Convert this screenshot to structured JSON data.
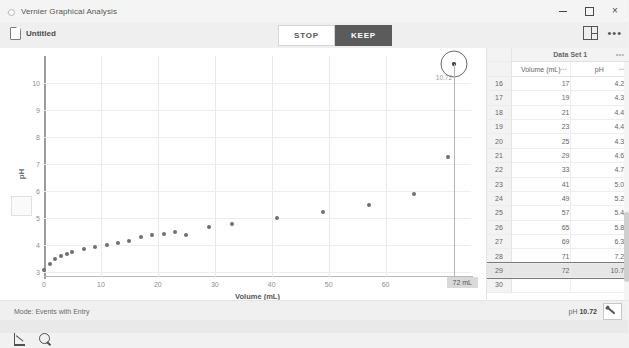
{
  "window": {
    "title": "Vernier Graphical Analysis",
    "logo_icon": "vernier-logo-icon",
    "minimize_label": "minimize-icon",
    "maximize_label": "maximize-icon",
    "close_label": "×"
  },
  "toolbar": {
    "doc_icon": "document-icon",
    "doc_name": "Untitled",
    "stop_label": "STOP",
    "keep_label": "KEEP",
    "layout_icon": "layout-split-icon",
    "more_icon": "•••"
  },
  "graph": {
    "ylabel": "pH",
    "xlabel": "Volume (mL)",
    "x_badge": "72 mL",
    "cursor_value": "10.72",
    "tool_graph_icon": "graph-axes-icon",
    "tool_zoom_icon": "zoom-magnifier-icon"
  },
  "chart_data": {
    "type": "scatter",
    "title": "",
    "xlabel": "Volume (mL)",
    "ylabel": "pH",
    "xlim": [
      0,
      75
    ],
    "ylim": [
      2.8,
      11.0
    ],
    "xticks": [
      0,
      10,
      20,
      30,
      40,
      50,
      60
    ],
    "yticks": [
      3,
      4,
      5,
      6,
      7,
      8,
      9,
      10
    ],
    "grid": true,
    "legend": "none",
    "marker_color": "#6f6f6f",
    "points": [
      {
        "x": 0,
        "y": 3.07
      },
      {
        "x": 1,
        "y": 3.3
      },
      {
        "x": 2,
        "y": 3.48
      },
      {
        "x": 3,
        "y": 3.58
      },
      {
        "x": 4,
        "y": 3.66
      },
      {
        "x": 5,
        "y": 3.73
      },
      {
        "x": 7,
        "y": 3.84
      },
      {
        "x": 9,
        "y": 3.93
      },
      {
        "x": 11,
        "y": 4.0
      },
      {
        "x": 13,
        "y": 4.07
      },
      {
        "x": 15,
        "y": 4.13
      },
      {
        "x": 17,
        "y": 4.29
      },
      {
        "x": 19,
        "y": 4.35
      },
      {
        "x": 21,
        "y": 4.41
      },
      {
        "x": 23,
        "y": 4.47
      },
      {
        "x": 25,
        "y": 4.34
      },
      {
        "x": 29,
        "y": 4.65
      },
      {
        "x": 33,
        "y": 4.77
      },
      {
        "x": 41,
        "y": 5.0
      },
      {
        "x": 49,
        "y": 5.21
      },
      {
        "x": 57,
        "y": 5.47
      },
      {
        "x": 65,
        "y": 5.88
      },
      {
        "x": 71,
        "y": 7.26
      },
      {
        "x": 72,
        "y": 10.72
      }
    ]
  },
  "table": {
    "dataset_title": "Data Set 1",
    "menu_icon": "•••",
    "columns": [
      "Volume (mL)",
      "pH"
    ],
    "rows": [
      {
        "idx": "16",
        "volume": "17",
        "ph": "4.29",
        "selected": false
      },
      {
        "idx": "17",
        "volume": "19",
        "ph": "4.35",
        "selected": false
      },
      {
        "idx": "18",
        "volume": "21",
        "ph": "4.41",
        "selected": false
      },
      {
        "idx": "19",
        "volume": "23",
        "ph": "4.47",
        "selected": false
      },
      {
        "idx": "20",
        "volume": "25",
        "ph": "4.34",
        "selected": false
      },
      {
        "idx": "21",
        "volume": "29",
        "ph": "4.65",
        "selected": false
      },
      {
        "idx": "22",
        "volume": "33",
        "ph": "4.77",
        "selected": false
      },
      {
        "idx": "23",
        "volume": "41",
        "ph": "5.00",
        "selected": false
      },
      {
        "idx": "24",
        "volume": "49",
        "ph": "5.21",
        "selected": false
      },
      {
        "idx": "25",
        "volume": "57",
        "ph": "5.47",
        "selected": false
      },
      {
        "idx": "26",
        "volume": "65",
        "ph": "5.88",
        "selected": false
      },
      {
        "idx": "27",
        "volume": "69",
        "ph": "6.39",
        "selected": false
      },
      {
        "idx": "28",
        "volume": "71",
        "ph": "7.26",
        "selected": false
      },
      {
        "idx": "29",
        "volume": "72",
        "ph": "10.72",
        "selected": true
      },
      {
        "idx": "30",
        "volume": "",
        "ph": "",
        "selected": false
      }
    ]
  },
  "status": {
    "mode": "Mode: Events with Entry",
    "reading_label": "pH",
    "reading_value": "10.72",
    "sensor_icon": "sensor-probe-icon"
  }
}
